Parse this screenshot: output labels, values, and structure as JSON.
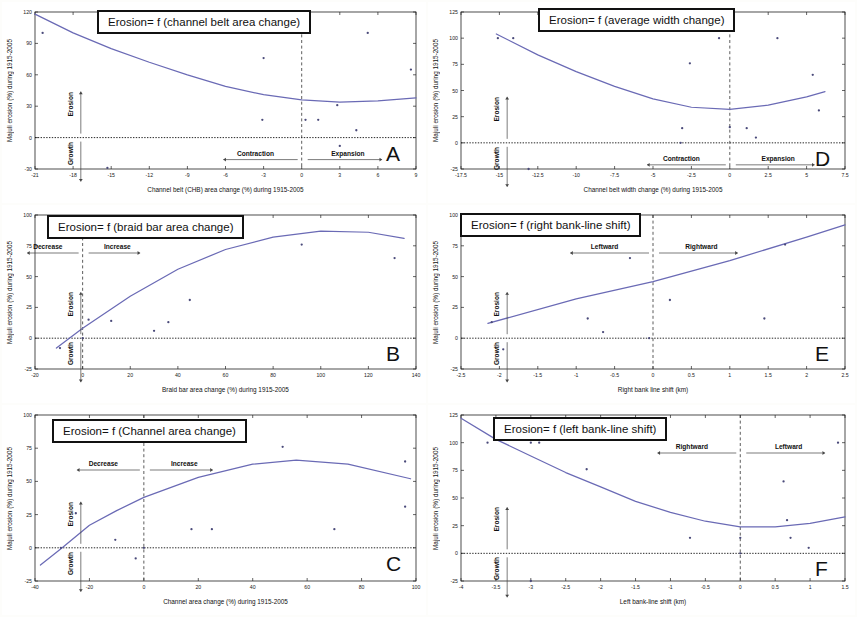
{
  "figure": {
    "background": "#fdfdfb",
    "curve_color": "#6a6ab5",
    "point_color": "#4a4a7a",
    "axis_color": "#222222"
  },
  "common": {
    "ylabel": "Majuli erosion (%) during 1915-2005",
    "erosion_label": "Erosion",
    "growth_label": "Growth"
  },
  "panels": [
    {
      "letter": "A",
      "title": "Erosion= f (channel belt area change)",
      "xlabel": "Channel belt (CHB) area change (%) during 1915-2005",
      "ylabel": "Majuli erosion (%) during 1915-2005",
      "left_region": "Contraction",
      "right_region": "Expansion",
      "chart_data": {
        "type": "scatter",
        "title": "Erosion= f (channel belt area change)",
        "xlabel": "Channel belt (CHB) area change (%) during 1915-2005",
        "ylabel": "Majuli erosion (%) during 1915-2005",
        "xlim": [
          -21,
          9
        ],
        "ylim": [
          -30,
          120
        ],
        "xticks": [
          -21,
          -18,
          -15,
          -12,
          -9,
          -6,
          -3,
          0,
          3,
          6,
          9
        ],
        "yticks": [
          -30,
          0,
          30,
          60,
          90,
          120
        ],
        "grid": false,
        "zero_line_y": 0,
        "vertical_ref_x": 0,
        "points": [
          {
            "x": -20.4,
            "y": 100
          },
          {
            "x": -15.3,
            "y": -29
          },
          {
            "x": -3.0,
            "y": 76
          },
          {
            "x": -3.1,
            "y": 17
          },
          {
            "x": 0.3,
            "y": 100
          },
          {
            "x": 0.3,
            "y": 17
          },
          {
            "x": 1.3,
            "y": 17
          },
          {
            "x": 2.8,
            "y": 31
          },
          {
            "x": 3.0,
            "y": -8
          },
          {
            "x": 4.3,
            "y": 7
          },
          {
            "x": 5.2,
            "y": 100
          },
          {
            "x": 8.6,
            "y": 65
          }
        ],
        "fit_curve": {
          "kind": "quadratic",
          "description": "concave-up quadratic trend, decreasing from ~118 at x=-21 to minimum ~34 near x=2, rising to ~38 at x=9",
          "samples": [
            {
              "x": -21,
              "y": 118
            },
            {
              "x": -18,
              "y": 100
            },
            {
              "x": -15,
              "y": 85
            },
            {
              "x": -12,
              "y": 72
            },
            {
              "x": -9,
              "y": 60
            },
            {
              "x": -6,
              "y": 49
            },
            {
              "x": -3,
              "y": 41
            },
            {
              "x": 0,
              "y": 36
            },
            {
              "x": 3,
              "y": 34
            },
            {
              "x": 6,
              "y": 35
            },
            {
              "x": 9,
              "y": 38
            }
          ]
        }
      }
    },
    {
      "letter": "D",
      "title": "Erosion= f (average width change)",
      "xlabel": "Channel belt width change (%) during 1915-2005",
      "ylabel": "Majuli erosion (%) during 1915-2005",
      "left_region": "Contraction",
      "right_region": "Expansion",
      "chart_data": {
        "type": "scatter",
        "title": "Erosion= f (average width change)",
        "xlabel": "Channel belt width change (%) during 1915-2005",
        "ylabel": "Majuli erosion (%) during 1915-2005",
        "xlim": [
          -17.5,
          7.5
        ],
        "ylim": [
          -25,
          125
        ],
        "xticks": [
          -17.5,
          -15,
          -12.5,
          -10,
          -7.5,
          -5,
          -2.5,
          0,
          2.5,
          5,
          7.5
        ],
        "yticks": [
          -25,
          0,
          25,
          50,
          75,
          100,
          125
        ],
        "grid": false,
        "zero_line_y": 0,
        "vertical_ref_x": 0,
        "points": [
          {
            "x": -15.1,
            "y": 100
          },
          {
            "x": -14.1,
            "y": 100
          },
          {
            "x": -13.1,
            "y": -25
          },
          {
            "x": -3.2,
            "y": 0
          },
          {
            "x": -3.1,
            "y": 14
          },
          {
            "x": -2.6,
            "y": 76
          },
          {
            "x": -0.7,
            "y": 100
          },
          {
            "x": 0.0,
            "y": 15
          },
          {
            "x": 1.1,
            "y": 14
          },
          {
            "x": 1.7,
            "y": 5
          },
          {
            "x": 3.1,
            "y": 100
          },
          {
            "x": 5.4,
            "y": 65
          },
          {
            "x": 5.8,
            "y": 31
          }
        ],
        "fit_curve": {
          "kind": "quadratic",
          "description": "concave-up quadratic, ~105 at x=-15, minimum ~32 near x=-1, rising to ~48 at x=6",
          "samples": [
            {
              "x": -15.2,
              "y": 104
            },
            {
              "x": -12.5,
              "y": 84
            },
            {
              "x": -10,
              "y": 68
            },
            {
              "x": -7.5,
              "y": 54
            },
            {
              "x": -5,
              "y": 42
            },
            {
              "x": -2.5,
              "y": 34
            },
            {
              "x": 0,
              "y": 32
            },
            {
              "x": 2.5,
              "y": 36
            },
            {
              "x": 5,
              "y": 44
            },
            {
              "x": 6.2,
              "y": 49
            }
          ]
        }
      }
    },
    {
      "letter": "B",
      "title": "Erosion= f (braid bar area change)",
      "xlabel": "Braid bar area change (%) during 1915-2005",
      "ylabel": "Majuli erosion (%) during 1915-2005",
      "left_region": "Decrease",
      "right_region": "Increase",
      "chart_data": {
        "type": "scatter",
        "title": "Erosion= f (braid bar area change)",
        "xlabel": "Braid bar area change (%) during 1915-2005",
        "ylabel": "Majuli erosion (%) during 1915-2005",
        "xlim": [
          -20,
          140
        ],
        "ylim": [
          -25,
          100
        ],
        "xticks": [
          -20,
          0,
          20,
          40,
          60,
          80,
          100,
          120,
          140
        ],
        "yticks": [
          -25,
          0,
          25,
          50,
          75,
          100
        ],
        "grid": false,
        "zero_line_y": 0,
        "vertical_ref_x": 0,
        "points": [
          {
            "x": -9.5,
            "y": -8
          },
          {
            "x": 0.0,
            "y": 0
          },
          {
            "x": 2.5,
            "y": 15
          },
          {
            "x": 12.0,
            "y": 14
          },
          {
            "x": 30.0,
            "y": 6
          },
          {
            "x": 36.0,
            "y": 13
          },
          {
            "x": 45.0,
            "y": 31
          },
          {
            "x": 92.0,
            "y": 76
          },
          {
            "x": 131.0,
            "y": 65
          }
        ],
        "fit_curve": {
          "kind": "quadratic",
          "description": "concave-down quadratic, rising from ~-12 at x=-20 through 0 near x=-7, to max ~87 near x=105, falling to ~81 at x=135",
          "samples": [
            {
              "x": -11,
              "y": -8
            },
            {
              "x": 0,
              "y": 8
            },
            {
              "x": 20,
              "y": 34
            },
            {
              "x": 40,
              "y": 56
            },
            {
              "x": 60,
              "y": 72
            },
            {
              "x": 80,
              "y": 82
            },
            {
              "x": 100,
              "y": 87
            },
            {
              "x": 120,
              "y": 86
            },
            {
              "x": 135,
              "y": 81
            }
          ]
        }
      }
    },
    {
      "letter": "E",
      "title": "Erosion= f (right bank-line shift)",
      "xlabel": "Right bank line shift (km)",
      "ylabel": "Majuli erosion (%) during 1915-2005",
      "left_region": "Leftward",
      "right_region": "Rightward",
      "chart_data": {
        "type": "scatter",
        "title": "Erosion= f (right bank-line shift)",
        "xlabel": "Right bank line shift (km)",
        "ylabel": "Majuli erosion (%) during 1915-2005",
        "xlim": [
          -2.5,
          2.5
        ],
        "ylim": [
          -25,
          100
        ],
        "xticks": [
          -2.5,
          -2,
          -1.5,
          -1,
          -0.5,
          0,
          0.5,
          1,
          1.5,
          2,
          2.5
        ],
        "yticks": [
          -25,
          0,
          25,
          50,
          75,
          100
        ],
        "grid": false,
        "zero_line_y": 0,
        "vertical_ref_x": 0,
        "points": [
          {
            "x": -2.1,
            "y": 13
          },
          {
            "x": -1.95,
            "y": -9
          },
          {
            "x": -0.85,
            "y": 16
          },
          {
            "x": -0.65,
            "y": 5
          },
          {
            "x": -0.3,
            "y": 65
          },
          {
            "x": -0.05,
            "y": 0
          },
          {
            "x": 0.22,
            "y": 31
          },
          {
            "x": 1.45,
            "y": 16
          },
          {
            "x": 1.72,
            "y": 76
          }
        ],
        "fit_curve": {
          "kind": "linear",
          "description": "straight increasing trend from ~13 at x=-2.1 to ~92 at x=2.5",
          "samples": [
            {
              "x": -2.15,
              "y": 12
            },
            {
              "x": -1,
              "y": 32
            },
            {
              "x": 0,
              "y": 46
            },
            {
              "x": 1,
              "y": 63
            },
            {
              "x": 2,
              "y": 82
            },
            {
              "x": 2.5,
              "y": 92
            }
          ]
        }
      }
    },
    {
      "letter": "C",
      "title": "Erosion= f (Channel area change)",
      "xlabel": "Channel area change (%) during 1915-2005",
      "ylabel": "Majuli erosion (%) during 1915-2005",
      "left_region": "Decrease",
      "right_region": "Increase",
      "chart_data": {
        "type": "scatter",
        "title": "Erosion= f (Channel area change)",
        "xlabel": "Channel area change (%) during 1915-2005",
        "ylabel": "Majuli erosion (%) during 1915-2005",
        "xlim": [
          -40,
          100
        ],
        "ylim": [
          -25,
          100
        ],
        "xticks": [
          -40,
          -20,
          0,
          20,
          40,
          60,
          80,
          100
        ],
        "yticks": [
          -25,
          0,
          25,
          50,
          75,
          100
        ],
        "grid": false,
        "zero_line_y": 0,
        "vertical_ref_x": 0,
        "points": [
          {
            "x": -30.5,
            "y": 0
          },
          {
            "x": -25.0,
            "y": 26
          },
          {
            "x": -10.5,
            "y": 6
          },
          {
            "x": -3.0,
            "y": -8
          },
          {
            "x": 0.0,
            "y": 0
          },
          {
            "x": 17.5,
            "y": 14
          },
          {
            "x": 25.0,
            "y": 14
          },
          {
            "x": 51.0,
            "y": 76
          },
          {
            "x": 70.0,
            "y": 14
          },
          {
            "x": 96.0,
            "y": 65
          },
          {
            "x": 96.0,
            "y": 31
          }
        ],
        "fit_curve": {
          "kind": "quadratic",
          "description": "concave-down quadratic, ~-12 at x=-38, crossing 0 near x=-30, max ~66 near x=56, decreasing to ~52 at x=98",
          "samples": [
            {
              "x": -38,
              "y": -13
            },
            {
              "x": -30,
              "y": 0
            },
            {
              "x": -20,
              "y": 17
            },
            {
              "x": -10,
              "y": 28
            },
            {
              "x": 0,
              "y": 38
            },
            {
              "x": 20,
              "y": 53
            },
            {
              "x": 40,
              "y": 63
            },
            {
              "x": 56,
              "y": 66
            },
            {
              "x": 75,
              "y": 63
            },
            {
              "x": 98,
              "y": 52
            }
          ]
        }
      }
    },
    {
      "letter": "F",
      "title": "Erosion= f (left bank-line shift)",
      "xlabel": "Left bank-line shift (km)",
      "ylabel": "Majuli erosion (%) during 1915-2005",
      "left_region": "Rightward",
      "right_region": "Leftward",
      "chart_data": {
        "type": "scatter",
        "title": "Erosion= f (left bank-line shift)",
        "xlabel": "Left bank-line shift (km)",
        "ylabel": "Majuli erosion (%) during 1915-2005",
        "xlim": [
          -4,
          1.5
        ],
        "ylim": [
          -25,
          125
        ],
        "xticks": [
          -4,
          -3.5,
          -3,
          -2.5,
          -2,
          -1.5,
          -1,
          -0.5,
          0,
          0.5,
          1,
          1.5
        ],
        "yticks": [
          -25,
          0,
          25,
          50,
          75,
          100,
          125
        ],
        "grid": false,
        "zero_line_y": 0,
        "vertical_ref_x": 0,
        "points": [
          {
            "x": -3.62,
            "y": 100
          },
          {
            "x": -3.0,
            "y": 100
          },
          {
            "x": -2.88,
            "y": 100
          },
          {
            "x": -3.0,
            "y": -25
          },
          {
            "x": -2.2,
            "y": 76
          },
          {
            "x": -0.72,
            "y": 14
          },
          {
            "x": 0.0,
            "y": 14
          },
          {
            "x": 0.0,
            "y": 0
          },
          {
            "x": 0.62,
            "y": 65
          },
          {
            "x": 0.67,
            "y": 30
          },
          {
            "x": 0.72,
            "y": 14
          },
          {
            "x": 0.98,
            "y": 5
          },
          {
            "x": 1.4,
            "y": 100
          }
        ],
        "fit_curve": {
          "kind": "quadratic",
          "description": "concave-up quadratic, ~122 at x=-4 decreasing to minimum ~24 near x=0.1, rising to ~32 at x=1.5",
          "samples": [
            {
              "x": -4,
              "y": 122
            },
            {
              "x": -3.5,
              "y": 103
            },
            {
              "x": -3,
              "y": 88
            },
            {
              "x": -2.5,
              "y": 73
            },
            {
              "x": -2,
              "y": 60
            },
            {
              "x": -1.5,
              "y": 47
            },
            {
              "x": -1,
              "y": 37
            },
            {
              "x": -0.5,
              "y": 29
            },
            {
              "x": 0,
              "y": 24
            },
            {
              "x": 0.5,
              "y": 24
            },
            {
              "x": 1,
              "y": 27
            },
            {
              "x": 1.5,
              "y": 33
            }
          ]
        }
      }
    }
  ]
}
